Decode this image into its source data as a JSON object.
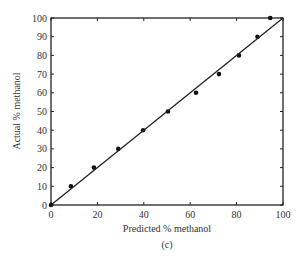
{
  "chart_data": {
    "type": "scatter",
    "title": "",
    "caption": "(c)",
    "xlabel": "Predicted % methanol",
    "ylabel": "Actual % methanol",
    "xlim": [
      0,
      100
    ],
    "ylim": [
      0,
      100
    ],
    "xticks": [
      0,
      20,
      40,
      60,
      80,
      100
    ],
    "yticks": [
      0,
      10,
      20,
      30,
      40,
      50,
      60,
      70,
      80,
      90,
      100
    ],
    "grid": false,
    "legend": null,
    "series": [
      {
        "name": "Samples",
        "marker": "filled-circle",
        "x": [
          0,
          8.6,
          18.5,
          29,
          39.7,
          50.4,
          62.5,
          72.4,
          81,
          89,
          94.5
        ],
        "y": [
          0,
          10,
          20,
          30,
          40,
          50,
          60,
          70,
          80,
          90,
          100
        ]
      },
      {
        "name": "Ideal y = x",
        "line": true,
        "x": [
          0,
          100
        ],
        "y": [
          0,
          100
        ]
      }
    ]
  }
}
